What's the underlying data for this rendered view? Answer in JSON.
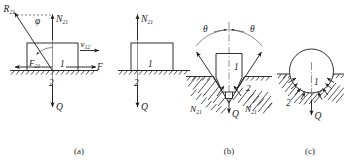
{
  "figure": {
    "background_color": "#ffffff",
    "ink_color": "#1a1a1a",
    "captions": [
      {
        "id": "a",
        "text": "(a)"
      },
      {
        "id": "b",
        "text": "(b)"
      },
      {
        "id": "c",
        "text": "(c)"
      }
    ]
  },
  "panel_a": {
    "caption": "(a)",
    "description": "Block 1 sliding on flat surface 2, resultant reaction decomposed",
    "labels": {
      "resultant_reaction": "R",
      "resultant_reaction_sub": "21",
      "friction_angle": "φ",
      "normal_force": "N",
      "normal_force_sub": "21",
      "friction_force": "F",
      "friction_force_sub": "21",
      "body": "1",
      "surface": "2",
      "velocity": "v",
      "velocity_sub": "12",
      "applied_force": "F",
      "load": "Q"
    }
  },
  "panel_a2": {
    "description": "Same block with only normal reaction and load shown",
    "labels": {
      "normal_force": "N",
      "normal_force_sub": "21",
      "body": "1",
      "surface": "2",
      "load": "Q"
    }
  },
  "panel_b": {
    "caption": "(b)",
    "description": "Prismatic body 1 seated in a V-groove of half angle theta in body 2",
    "labels": {
      "half_angle_left": "θ",
      "half_angle_right": "θ",
      "body": "1",
      "groove": "2",
      "normal_force_left": "N",
      "normal_force_left_sub": "21",
      "normal_force_right": "N",
      "normal_force_right_sub": "21",
      "load": "Q"
    }
  },
  "panel_c": {
    "caption": "(c)",
    "description": "Cylindrical body 1 resting in a curved seat 2 with distributed normal reactions",
    "labels": {
      "body": "1",
      "seat": "2",
      "load": "Q"
    }
  }
}
